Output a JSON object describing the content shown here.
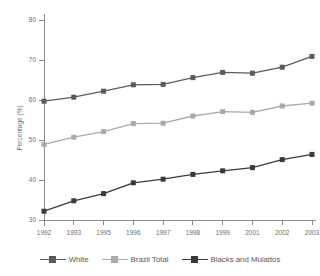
{
  "chart_data": {
    "type": "line",
    "title": "",
    "subtitle": "",
    "xlabel": "",
    "ylabel": "Percentage (%)",
    "categories": [
      "1992",
      "1993",
      "1995",
      "1996",
      "1997",
      "1998",
      "1999",
      "2001",
      "2002",
      "2003"
    ],
    "ylim": [
      30,
      80
    ],
    "yticks": [
      30,
      40,
      50,
      60,
      70,
      80
    ],
    "yticklabels": [
      "30",
      "40",
      "50",
      "60",
      "70",
      "80"
    ],
    "grid": false,
    "legend_position": "bottom",
    "series": [
      {
        "name": "White",
        "color": "#5b5b5b",
        "marker": "square",
        "values": [
          59.7,
          60.7,
          62.2,
          63.8,
          63.9,
          65.6,
          66.9,
          66.7,
          68.2,
          70.9
        ]
      },
      {
        "name": "Brazil Total",
        "color": "#aaaaaa",
        "marker": "square",
        "values": [
          48.9,
          50.7,
          52.1,
          54.1,
          54.2,
          56.0,
          57.1,
          56.9,
          58.5,
          59.2
        ]
      },
      {
        "name": "Blacks and Mulattos",
        "color": "#3a3a3a",
        "marker": "square",
        "values": [
          32.2,
          34.8,
          36.6,
          39.3,
          40.2,
          41.4,
          42.3,
          43.1,
          45.1,
          46.4
        ]
      }
    ]
  },
  "axis": {
    "y_title": "Percentage (%)",
    "y_tick_labels": [
      "80",
      "70",
      "60",
      "50",
      "40",
      "30"
    ],
    "x_tick_labels": [
      "1992",
      "1993",
      "1995",
      "1996",
      "1997",
      "1998",
      "1999",
      "2001",
      "2002",
      "2003"
    ]
  },
  "legend": {
    "items": [
      {
        "label": "White",
        "color": "#5b5b5b"
      },
      {
        "label": "Brazil Total",
        "color": "#aaaaaa"
      },
      {
        "label": "Blacks and Mulattos",
        "color": "#3a3a3a"
      }
    ]
  },
  "colors": {
    "background": "#ffffff",
    "axis": "#8d8d8d",
    "text": "#6e6e6e",
    "white_series": "#5b5b5b",
    "brazil_total_series": "#aaaaaa",
    "blacks_mulattos_series": "#3a3a3a"
  }
}
